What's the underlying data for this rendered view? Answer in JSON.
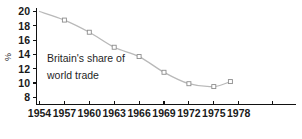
{
  "chart_data": {
    "type": "line",
    "title": "",
    "subtitle": "",
    "annotation": {
      "line1": "Britain's share of",
      "line2": "world trade"
    },
    "xlabel": "",
    "ylabel": "%",
    "x": [
      1954,
      1957,
      1960,
      1963,
      1966,
      1969,
      1972,
      1975,
      1977
    ],
    "values": [
      20.0,
      18.8,
      17.1,
      15.0,
      13.7,
      11.5,
      9.9,
      9.5,
      10.2
    ],
    "series": [
      {
        "name": "Britain's share of world trade",
        "values": [
          20.0,
          18.8,
          17.1,
          15.0,
          13.7,
          11.5,
          9.9,
          9.5,
          10.2
        ]
      }
    ],
    "x_tick_labels": [
      "1954",
      "1957",
      "1960",
      "1963",
      "1966",
      "1969",
      "1972",
      "1975",
      "1978"
    ],
    "x_tick_values": [
      1954,
      1957,
      1960,
      1963,
      1966,
      1969,
      1972,
      1975,
      1978
    ],
    "x_extra_unlabeled_ticks": [
      1981
    ],
    "y_tick_labels": [
      "20",
      "18",
      "16",
      "14",
      "12",
      "10",
      "8"
    ],
    "y_tick_values": [
      20,
      18,
      16,
      14,
      12,
      10,
      8
    ],
    "xlim": [
      1954,
      1983
    ],
    "ylim": [
      7,
      20.6
    ],
    "grid": false,
    "legend": false,
    "legend_position": "none",
    "colors": {
      "line": "#b9b9b9",
      "marker_fill": "#ffffff",
      "marker_stroke": "#8d8d8d",
      "axis": "#111111",
      "text": "#1a1a1a",
      "background": "#ffffff"
    }
  }
}
